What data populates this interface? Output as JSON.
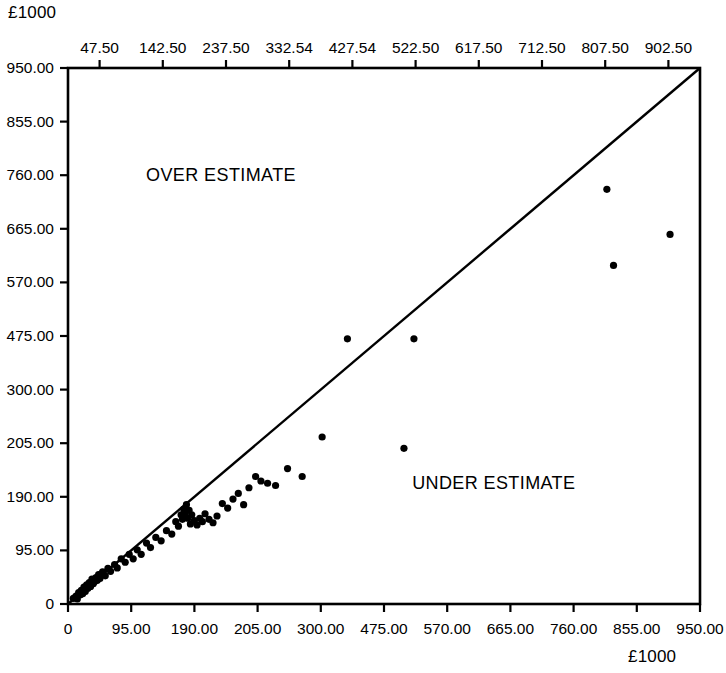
{
  "chart_data": {
    "type": "scatter",
    "title": "",
    "xlabel": "£1000",
    "ylabel": "£1000",
    "unit_label_top": "£1000",
    "unit_label_bottom": "£1000",
    "xlim": [
      0,
      950
    ],
    "ylim": [
      0,
      950
    ],
    "grid": false,
    "legend": null,
    "annotations": [
      {
        "text": "OVER ESTIMATE",
        "x": 230,
        "y": 760
      },
      {
        "text": "UNDER ESTIMATE",
        "x": 640,
        "y": 215
      }
    ],
    "reference_line": {
      "name": "parity-line",
      "from": [
        0,
        0
      ],
      "to": [
        950,
        950
      ],
      "description": "45 degree line of perfect estimate"
    },
    "axes": {
      "bottom_tick_labels": [
        "0",
        "95.00",
        "190.00",
        "205.00",
        "300.00",
        "475.00",
        "570.00",
        "665.00",
        "760.00",
        "855.00",
        "950.00"
      ],
      "left_tick_labels": [
        "0",
        "95.00",
        "190.00",
        "205.00",
        "300.00",
        "475.00",
        "570.00",
        "665.00",
        "760.00",
        "855.00",
        "950.00"
      ],
      "top_tick_labels": [
        "47.50",
        "142.50",
        "237.50",
        "332.54",
        "427.54",
        "522.50",
        "617.50",
        "712.50",
        "807.50",
        "902.50"
      ]
    },
    "series": [
      {
        "name": "projects",
        "marker": "filled-circle",
        "color": "#000000",
        "points": [
          [
            8,
            10
          ],
          [
            12,
            14
          ],
          [
            14,
            9
          ],
          [
            16,
            20
          ],
          [
            18,
            16
          ],
          [
            20,
            24
          ],
          [
            22,
            18
          ],
          [
            24,
            30
          ],
          [
            26,
            22
          ],
          [
            28,
            34
          ],
          [
            30,
            28
          ],
          [
            32,
            38
          ],
          [
            34,
            31
          ],
          [
            36,
            44
          ],
          [
            38,
            36
          ],
          [
            40,
            40
          ],
          [
            42,
            47
          ],
          [
            44,
            42
          ],
          [
            46,
            52
          ],
          [
            48,
            45
          ],
          [
            52,
            57
          ],
          [
            56,
            50
          ],
          [
            60,
            63
          ],
          [
            64,
            58
          ],
          [
            70,
            70
          ],
          [
            74,
            64
          ],
          [
            80,
            80
          ],
          [
            86,
            74
          ],
          [
            92,
            88
          ],
          [
            98,
            80
          ],
          [
            104,
            96
          ],
          [
            110,
            88
          ],
          [
            118,
            108
          ],
          [
            124,
            100
          ],
          [
            132,
            118
          ],
          [
            140,
            112
          ],
          [
            148,
            130
          ],
          [
            156,
            124
          ],
          [
            162,
            146
          ],
          [
            166,
            138
          ],
          [
            170,
            158
          ],
          [
            172,
            150
          ],
          [
            174,
            168
          ],
          [
            176,
            160
          ],
          [
            178,
            176
          ],
          [
            180,
            152
          ],
          [
            182,
            166
          ],
          [
            184,
            142
          ],
          [
            186,
            158
          ],
          [
            190,
            148
          ],
          [
            194,
            140
          ],
          [
            198,
            152
          ],
          [
            202,
            146
          ],
          [
            206,
            160
          ],
          [
            212,
            150
          ],
          [
            218,
            144
          ],
          [
            224,
            156
          ],
          [
            232,
            178
          ],
          [
            240,
            170
          ],
          [
            248,
            186
          ],
          [
            256,
            196
          ],
          [
            264,
            176
          ],
          [
            272,
            206
          ],
          [
            282,
            226
          ],
          [
            290,
            218
          ],
          [
            300,
            214
          ],
          [
            312,
            210
          ],
          [
            330,
            240
          ],
          [
            352,
            226
          ],
          [
            382,
            296
          ],
          [
            420,
            470
          ],
          [
            505,
            276
          ],
          [
            520,
            470
          ],
          [
            810,
            735
          ],
          [
            820,
            600
          ],
          [
            905,
            655
          ]
        ]
      }
    ]
  },
  "frame": {
    "left": 68,
    "top": 68,
    "right": 700,
    "bottom": 604
  }
}
